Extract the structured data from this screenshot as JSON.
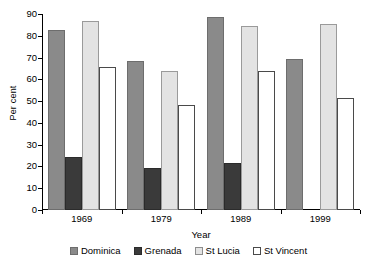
{
  "chart_data": {
    "type": "bar",
    "title": "",
    "xlabel": "Year",
    "ylabel": "Per cent",
    "categories": [
      "1969",
      "1979",
      "1989",
      "1999"
    ],
    "ylim": [
      0,
      90
    ],
    "yticks": [
      0,
      10,
      20,
      30,
      40,
      50,
      60,
      70,
      80,
      90
    ],
    "ytick_labels": [
      "0",
      "10",
      "20",
      "30",
      "40",
      "50",
      "60",
      "70",
      "80",
      "90"
    ],
    "grid": false,
    "legend_position": "bottom",
    "series": [
      {
        "name": "Dominica",
        "color": "#8a8a8a",
        "values": [
          82.5,
          68.5,
          88.5,
          69.5
        ]
      },
      {
        "name": "Grenada",
        "color": "#3a3a3a",
        "values": [
          24.5,
          19.5,
          21.5,
          null
        ]
      },
      {
        "name": "St Lucia",
        "color": "#e3e3e3",
        "values": [
          87.0,
          64.0,
          84.5,
          85.5
        ]
      },
      {
        "name": "St Vincent",
        "color": "#ffffff",
        "values": [
          65.5,
          48.0,
          64.0,
          51.5
        ]
      }
    ]
  }
}
